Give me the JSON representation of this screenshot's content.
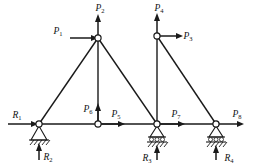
{
  "diagram": {
    "type": "structural-truss",
    "line_color": "#1a1a1a",
    "background_color": "#ffffff"
  },
  "loads": [
    {
      "id": "P1",
      "letter": "P",
      "sub": "1",
      "direction": "right",
      "at_node": "apex-left",
      "label_x": 58,
      "label_y": 34
    },
    {
      "id": "P2",
      "letter": "P",
      "sub": "2",
      "direction": "up",
      "at_node": "apex-left",
      "label_x": 100,
      "label_y": 11
    },
    {
      "id": "P3",
      "letter": "P",
      "sub": "3",
      "direction": "right",
      "at_node": "apex-right",
      "label_x": 184,
      "label_y": 36
    },
    {
      "id": "P4",
      "letter": "P",
      "sub": "4",
      "direction": "up",
      "at_node": "apex-right",
      "label_x": 159,
      "label_y": 11
    },
    {
      "id": "P5",
      "letter": "P",
      "sub": "5",
      "direction": "right",
      "at_node": "mid-bottom",
      "label_x": 116,
      "label_y": 117
    },
    {
      "id": "P6",
      "letter": "P",
      "sub": "6",
      "direction": "up",
      "at_node": "mid-bottom",
      "label_x": 86,
      "label_y": 112
    },
    {
      "id": "P7",
      "letter": "P",
      "sub": "7",
      "direction": "right",
      "at_node": "node-r3",
      "label_x": 176,
      "label_y": 117
    },
    {
      "id": "P8",
      "letter": "P",
      "sub": "8",
      "direction": "right",
      "at_node": "node-r4",
      "label_x": 235,
      "label_y": 117
    }
  ],
  "reactions": [
    {
      "id": "R1",
      "letter": "R",
      "sub": "1",
      "direction": "right",
      "at_node": "node-r1",
      "label_x": 16,
      "label_y": 117
    },
    {
      "id": "R2",
      "letter": "R",
      "sub": "2",
      "direction": "up",
      "at_node": "node-r1",
      "label_x": 46,
      "label_y": 159
    },
    {
      "id": "R3",
      "letter": "R",
      "sub": "3",
      "direction": "up",
      "at_node": "node-r3",
      "label_x": 146,
      "label_y": 159
    },
    {
      "id": "R4",
      "letter": "R",
      "sub": "4",
      "direction": "up",
      "at_node": "node-r4",
      "label_x": 234,
      "label_y": 159
    }
  ],
  "nodes": [
    {
      "id": "node-r1",
      "x": 39,
      "y": 124
    },
    {
      "id": "mid-bottom",
      "x": 98,
      "y": 124
    },
    {
      "id": "node-r3",
      "x": 157,
      "y": 124
    },
    {
      "id": "node-r4",
      "x": 216,
      "y": 124
    },
    {
      "id": "apex-left",
      "x": 98,
      "y": 38
    },
    {
      "id": "apex-right",
      "x": 157,
      "y": 36
    }
  ],
  "members": [
    {
      "from": "node-r1",
      "to": "apex-left"
    },
    {
      "from": "apex-left",
      "to": "node-r3"
    },
    {
      "from": "apex-left",
      "to": "mid-bottom"
    },
    {
      "from": "apex-right",
      "to": "node-r4"
    },
    {
      "from": "apex-right",
      "to": "node-r3"
    },
    {
      "from": "node-r1",
      "to": "node-r4"
    }
  ],
  "supports": [
    {
      "id": "support-pin",
      "type": "pin",
      "at_node": "node-r1",
      "x": 39,
      "y": 124
    },
    {
      "id": "support-roller-1",
      "type": "roller",
      "at_node": "node-r3",
      "x": 157,
      "y": 124
    },
    {
      "id": "support-roller-2",
      "type": "roller",
      "at_node": "node-r4",
      "x": 216,
      "y": 124
    }
  ]
}
